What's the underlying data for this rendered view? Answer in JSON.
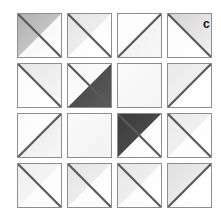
{
  "figure": {
    "panel_label": "c",
    "background_color": "#ffffff",
    "border_color": "#8e8e8e",
    "tile_base_color": "#fdfdfd",
    "grid": {
      "rows": 4,
      "columns": 4,
      "tile_size_px": 45,
      "gap_px": 5
    }
  },
  "chart_data": {
    "type": "heatmap",
    "title": "",
    "subtitle": "",
    "xlabel": "",
    "ylabel": "",
    "legend": [],
    "annotations": [
      "c"
    ],
    "grid": true,
    "rows": 4,
    "columns": 4,
    "categories": [
      "col-1",
      "col-2",
      "col-3",
      "col-4"
    ],
    "row_labels": [
      "row-1",
      "row-2",
      "row-3",
      "row-4"
    ],
    "value_scale": {
      "min": 0,
      "max": 1,
      "units": "normalized gray darkness"
    },
    "tiles": [
      {
        "id": "tile-r1c1",
        "row": 1,
        "col": 1,
        "diagonal": "main",
        "shaded_half": "upper-left",
        "shade_level": 0.34,
        "fill_start": "#b0b0b0",
        "fill_end": "#d6d6d6",
        "opposite_fill_start": "#ffffff",
        "opposite_fill_end": "#f2f2f2"
      },
      {
        "id": "tile-r1c2",
        "row": 1,
        "col": 2,
        "diagonal": "main",
        "shaded_half": "upper-left",
        "shade_level": 0.12,
        "fill_start": "#e4e4e4",
        "fill_end": "#f6f6f6",
        "opposite_fill_start": "#ffffff",
        "opposite_fill_end": "#fafafa"
      },
      {
        "id": "tile-r1c3",
        "row": 1,
        "col": 3,
        "diagonal": "anti",
        "shaded_half": "lower-right",
        "shade_level": 0.08,
        "fill_start": "#ededed",
        "fill_end": "#f8f8f8",
        "opposite_fill_start": "#ffffff",
        "opposite_fill_end": "#fcfcfc"
      },
      {
        "id": "tile-r1c4",
        "row": 1,
        "col": 4,
        "diagonal": "main",
        "shaded_half": "upper-right",
        "shade_level": 0.18,
        "fill_start": "#d4d4d4",
        "fill_end": "#f2f2f2",
        "opposite_fill_start": "#ffffff",
        "opposite_fill_end": "#fbfbfb"
      },
      {
        "id": "tile-r2c1",
        "row": 2,
        "col": 1,
        "diagonal": "main",
        "shaded_half": "upper-right",
        "shade_level": 0.12,
        "fill_start": "#e6e6e6",
        "fill_end": "#f7f7f7",
        "opposite_fill_start": "#ffffff",
        "opposite_fill_end": "#fafafa"
      },
      {
        "id": "tile-r2c2",
        "row": 2,
        "col": 2,
        "diagonal": "main",
        "shaded_half": "lower-right",
        "shade_level": 0.78,
        "fill_start": "#3f3f3f",
        "fill_end": "#5c5c5c",
        "opposite_fill_start": "#ffffff",
        "opposite_fill_end": "#f7f7f7"
      },
      {
        "id": "tile-r2c3",
        "row": 2,
        "col": 3,
        "diagonal": "none",
        "shaded_half": "none",
        "shade_level": 0.03,
        "fill_start": "#fbfbfb",
        "fill_end": "#f4f4f4",
        "opposite_fill_start": "#fbfbfb",
        "opposite_fill_end": "#f4f4f4"
      },
      {
        "id": "tile-r2c4",
        "row": 2,
        "col": 4,
        "diagonal": "anti",
        "shaded_half": "upper-left",
        "shade_level": 0.1,
        "fill_start": "#e9e9e9",
        "fill_end": "#f8f8f8",
        "opposite_fill_start": "#ffffff",
        "opposite_fill_end": "#fcfcfc"
      },
      {
        "id": "tile-r3c1",
        "row": 3,
        "col": 1,
        "diagonal": "anti",
        "shaded_half": "lower-right",
        "shade_level": 0.11,
        "fill_start": "#e7e7e7",
        "fill_end": "#f7f7f7",
        "opposite_fill_start": "#ffffff",
        "opposite_fill_end": "#fbfbfb"
      },
      {
        "id": "tile-r3c2",
        "row": 3,
        "col": 2,
        "diagonal": "none",
        "shaded_half": "none",
        "shade_level": 0.04,
        "fill_start": "#fafafa",
        "fill_end": "#f2f2f2",
        "opposite_fill_start": "#fafafa",
        "opposite_fill_end": "#f2f2f2"
      },
      {
        "id": "tile-r3c3",
        "row": 3,
        "col": 3,
        "diagonal": "main",
        "shaded_half": "upper-left",
        "shade_level": 0.8,
        "fill_start": "#3b3b3b",
        "fill_end": "#555555",
        "opposite_fill_start": "#ffffff",
        "opposite_fill_end": "#f7f7f7"
      },
      {
        "id": "tile-r3c4",
        "row": 3,
        "col": 4,
        "diagonal": "main",
        "shaded_half": "upper-left",
        "shade_level": 0.1,
        "fill_start": "#e9e9e9",
        "fill_end": "#f8f8f8",
        "opposite_fill_start": "#ffffff",
        "opposite_fill_end": "#fbfbfb"
      },
      {
        "id": "tile-r4c1",
        "row": 4,
        "col": 1,
        "diagonal": "main",
        "shaded_half": "upper-left",
        "shade_level": 0.07,
        "fill_start": "#efefef",
        "fill_end": "#f9f9f9",
        "opposite_fill_start": "#ffffff",
        "opposite_fill_end": "#fafafa"
      },
      {
        "id": "tile-r4c2",
        "row": 4,
        "col": 2,
        "diagonal": "main",
        "shaded_half": "upper-left",
        "shade_level": 0.13,
        "fill_start": "#e3e3e3",
        "fill_end": "#f6f6f6",
        "opposite_fill_start": "#ffffff",
        "opposite_fill_end": "#fbfbfb"
      },
      {
        "id": "tile-r4c3",
        "row": 4,
        "col": 3,
        "diagonal": "main",
        "shaded_half": "upper-left",
        "shade_level": 0.11,
        "fill_start": "#e6e6e6",
        "fill_end": "#f7f7f7",
        "opposite_fill_start": "#ffffff",
        "opposite_fill_end": "#fbfbfb"
      },
      {
        "id": "tile-r4c4",
        "row": 4,
        "col": 4,
        "diagonal": "anti",
        "shaded_half": "upper-left",
        "shade_level": 0.14,
        "fill_start": "#e0e0e0",
        "fill_end": "#f5f5f5",
        "opposite_fill_start": "#ffffff",
        "opposite_fill_end": "#fbfbfb"
      }
    ]
  }
}
